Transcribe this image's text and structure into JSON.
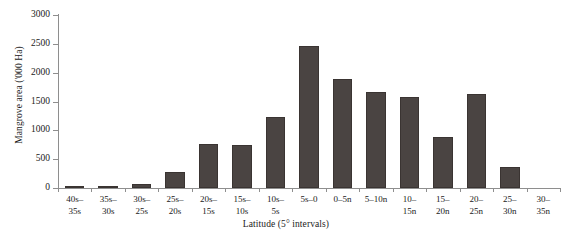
{
  "chart_data": {
    "type": "bar",
    "title": "",
    "xlabel": "Latitude (5° intervals)",
    "ylabel": "Mangrove area ('000 Ha)",
    "categories": [
      "40s–\n35s",
      "35s–\n30s",
      "30s–\n25s",
      "25s–\n20s",
      "20s–\n15s",
      "15s–\n10s",
      "10s–\n5s",
      "5s–0",
      "0–5n",
      "5–10n",
      "10–\n15n",
      "15–\n20n",
      "20–\n25n",
      "25–\n30n",
      "30–\n35n"
    ],
    "values": [
      20,
      25,
      70,
      270,
      760,
      740,
      1240,
      2470,
      1890,
      1670,
      1570,
      890,
      1630,
      370,
      0
    ],
    "ylim": [
      0,
      3000
    ],
    "yticks": [
      0,
      500,
      1000,
      1500,
      2000,
      2500,
      3000
    ],
    "ytick_labels": [
      "0",
      "500",
      "1000",
      "1500",
      "2000",
      "2500",
      "3000"
    ],
    "grid": false,
    "legend": "none",
    "bar_color": "#4a4442",
    "axis_color": "#8e8e8e",
    "background": "#ffffff"
  }
}
